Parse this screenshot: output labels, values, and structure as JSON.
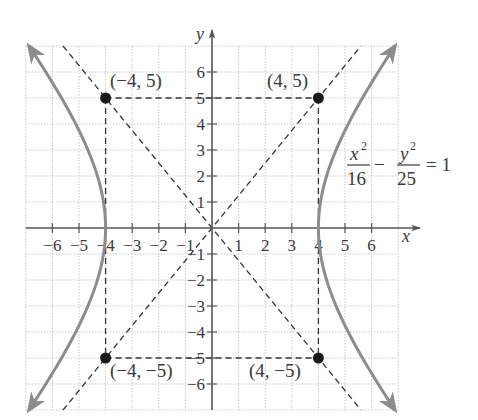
{
  "chart_data": {
    "type": "line",
    "title": "",
    "equation": {
      "x_numerator": "x",
      "x_exp": "2",
      "x_denominator": "16",
      "minus": "−",
      "y_numerator": "y",
      "y_exp": "2",
      "y_denominator": "25",
      "rhs": "= 1"
    },
    "xlabel": "x",
    "ylabel": "y",
    "xlim": [
      -7,
      7
    ],
    "ylim": [
      -7,
      7
    ],
    "grid": true,
    "x_ticks": [
      -6,
      -5,
      -4,
      -3,
      -2,
      -1,
      1,
      2,
      3,
      4,
      5,
      6
    ],
    "y_ticks": [
      6,
      5,
      4,
      3,
      2,
      1,
      -1,
      -2,
      -3,
      -4,
      -5,
      -6
    ],
    "x_tick_labels": [
      "−6",
      "−5",
      "−4",
      "−3",
      "−2",
      "−1",
      "1",
      "2",
      "3",
      "4",
      "5",
      "6"
    ],
    "y_tick_labels": [
      "6",
      "5",
      "4",
      "3",
      "2",
      "1",
      "−1",
      "−2",
      "−3",
      "−4",
      "−5",
      "−6"
    ],
    "series": [
      {
        "name": "hyperbola x^2/16 - y^2/25 = 1 (right branch)",
        "a": 4,
        "b": 5,
        "branch": "right",
        "style": "solid gray with arrows"
      },
      {
        "name": "hyperbola x^2/16 - y^2/25 = 1 (left branch)",
        "a": 4,
        "b": 5,
        "branch": "left",
        "style": "solid gray with arrows"
      },
      {
        "name": "asymptote y = 5/4 x",
        "slope": 1.25,
        "style": "dashed"
      },
      {
        "name": "asymptote y = -5/4 x",
        "slope": -1.25,
        "style": "dashed"
      },
      {
        "name": "central rectangle",
        "corners": [
          [
            -4,
            5
          ],
          [
            4,
            5
          ],
          [
            4,
            -5
          ],
          [
            -4,
            -5
          ]
        ],
        "style": "dashed"
      }
    ],
    "points": [
      {
        "x": -4,
        "y": 5,
        "label": "(−4, 5)"
      },
      {
        "x": 4,
        "y": 5,
        "label": "(4, 5)"
      },
      {
        "x": -4,
        "y": -5,
        "label": "(−4, −5)"
      },
      {
        "x": 4,
        "y": -5,
        "label": "(4, −5)"
      }
    ],
    "vertices": [
      [
        -4,
        0
      ],
      [
        4,
        0
      ]
    ]
  },
  "colors": {
    "curve": "#8c8c8c",
    "dashed": "#333333",
    "axis": "#555555",
    "grid": "#c8c8c8",
    "point": "#1a1a1a",
    "text": "#3a3a3a"
  }
}
